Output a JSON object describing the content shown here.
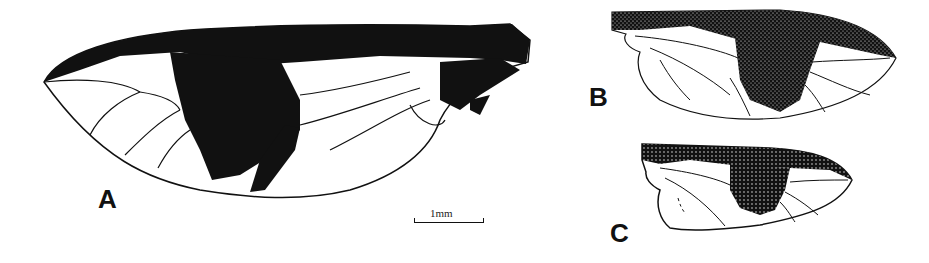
{
  "figure": {
    "panels": [
      {
        "id": "A",
        "label": "A",
        "description": "large wing with dark central band and dark costal margin"
      },
      {
        "id": "B",
        "label": "B",
        "description": "stippled wing, dark costal band and central patch"
      },
      {
        "id": "C",
        "label": "C",
        "description": "smaller stippled wing, dark costal band and central patch"
      }
    ],
    "scale_bar": {
      "label": "1mm"
    },
    "colors": {
      "ink": "#111111",
      "background": "#ffffff"
    }
  }
}
